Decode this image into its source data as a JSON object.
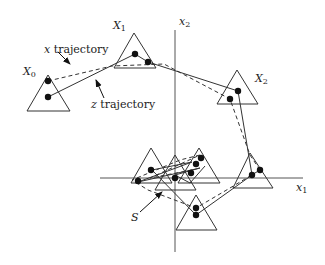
{
  "diagram": {
    "title": "",
    "colors": {
      "stroke": "#333333",
      "axis": "#555555",
      "point": "#111111",
      "background": "#ffffff"
    },
    "axes": {
      "x1": {
        "label_var": "x",
        "label_sub": "1"
      },
      "x2": {
        "label_var": "x",
        "label_sub": "2"
      }
    },
    "labels": {
      "X0": {
        "var": "X",
        "sub": "0"
      },
      "X1": {
        "var": "X",
        "sub": "1"
      },
      "X2": {
        "var": "X",
        "sub": "2"
      },
      "x_trajectory": {
        "var": "x",
        "text": " trajectory"
      },
      "z_trajectory": {
        "var": "z",
        "text": " trajectory"
      },
      "S": "S"
    },
    "legend": [
      {
        "name": "x trajectory",
        "style": "dashed"
      },
      {
        "name": "z trajectory",
        "style": "solid"
      }
    ]
  }
}
